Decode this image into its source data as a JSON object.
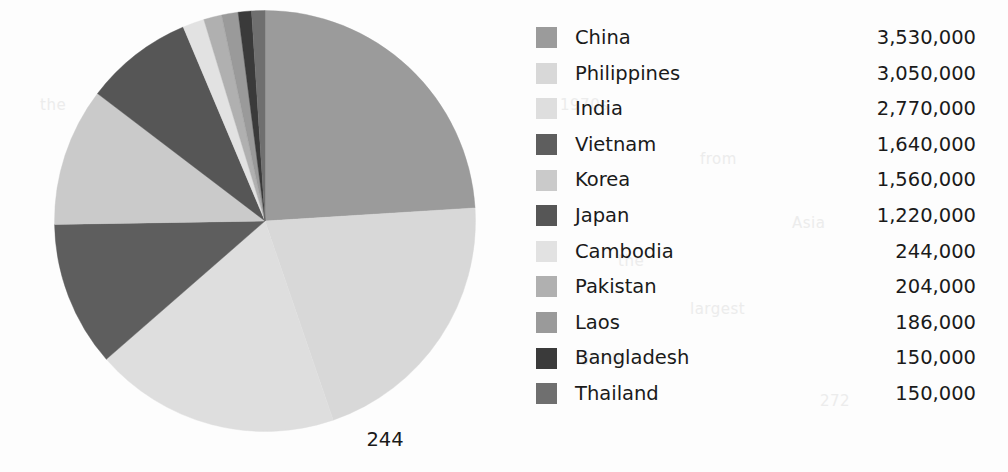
{
  "page": {
    "page_number": "244",
    "background_color": "#fdfdfd",
    "text_color": "#1a1a1a"
  },
  "bleed_text": [
    {
      "text": "the",
      "x": 40,
      "y": 96
    },
    {
      "text": "immi",
      "x": 96,
      "y": 150
    },
    {
      "text": "grants",
      "x": 84,
      "y": 176
    },
    {
      "text": "were",
      "x": 92,
      "y": 202
    },
    {
      "text": "in",
      "x": 112,
      "y": 228
    },
    {
      "text": "1970s",
      "x": 560,
      "y": 96
    },
    {
      "text": "from",
      "x": 700,
      "y": 150
    },
    {
      "text": "Asia",
      "x": 792,
      "y": 214
    },
    {
      "text": "the",
      "x": 618,
      "y": 252
    },
    {
      "text": "largest",
      "x": 690,
      "y": 300
    },
    {
      "text": "group",
      "x": 580,
      "y": 348
    },
    {
      "text": "272",
      "x": 820,
      "y": 392
    }
  ],
  "chart_data": {
    "type": "pie",
    "title": "",
    "unit": "people",
    "total": 14704000,
    "start_angle_deg": 0,
    "direction": "clockwise",
    "legend_position": "right",
    "legend_headers": {
      "label": "",
      "value": ""
    },
    "categories": [
      "China",
      "Philippines",
      "India",
      "Vietnam",
      "Korea",
      "Japan",
      "Cambodia",
      "Pakistan",
      "Laos",
      "Bangladesh",
      "Thailand"
    ],
    "values": [
      3530000,
      3050000,
      2770000,
      1640000,
      1560000,
      1220000,
      244000,
      204000,
      186000,
      150000,
      150000
    ],
    "value_labels": [
      "3,530,000",
      "3,050,000",
      "2,770,000",
      "1,640,000",
      "1,560,000",
      "1,220,000",
      "244,000",
      "204,000",
      "186,000",
      "150,000",
      "150,000"
    ],
    "percentages": [
      24.01,
      20.74,
      18.84,
      11.15,
      10.61,
      8.3,
      1.66,
      1.39,
      1.27,
      1.02,
      1.02
    ],
    "colors": [
      "#9b9b9b",
      "#d8d8d8",
      "#dedede",
      "#5e5e5e",
      "#cacaca",
      "#565656",
      "#e2e2e2",
      "#b0b0b0",
      "#9a9a9a",
      "#3a3a3a",
      "#6f6f6f"
    ]
  },
  "legend": {
    "items": [
      {
        "label": "China",
        "value": "3,530,000",
        "color": "#9b9b9b"
      },
      {
        "label": "Philippines",
        "value": "3,050,000",
        "color": "#d8d8d8"
      },
      {
        "label": "India",
        "value": "2,770,000",
        "color": "#dedede"
      },
      {
        "label": "Vietnam",
        "value": "1,640,000",
        "color": "#5e5e5e"
      },
      {
        "label": "Korea",
        "value": "1,560,000",
        "color": "#cacaca"
      },
      {
        "label": "Japan",
        "value": "1,220,000",
        "color": "#565656"
      },
      {
        "label": "Cambodia",
        "value": "244,000",
        "color": "#e2e2e2"
      },
      {
        "label": "Pakistan",
        "value": "204,000",
        "color": "#b0b0b0"
      },
      {
        "label": "Laos",
        "value": "186,000",
        "color": "#9a9a9a"
      },
      {
        "label": "Bangladesh",
        "value": "150,000",
        "color": "#3a3a3a"
      },
      {
        "label": "Thailand",
        "value": "150,000",
        "color": "#6f6f6f"
      }
    ]
  }
}
